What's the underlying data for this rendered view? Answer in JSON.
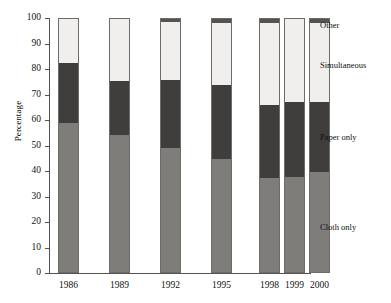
{
  "chart_data": {
    "type": "bar",
    "stacked": true,
    "title": "",
    "xlabel": "",
    "ylabel": "Percentage",
    "ylim": [
      0,
      100
    ],
    "yticks": [
      0,
      10,
      20,
      30,
      40,
      50,
      60,
      70,
      80,
      90,
      100
    ],
    "grid": false,
    "legend_position": "right",
    "categories": [
      "1986",
      "1989",
      "1992",
      "1995",
      "1998",
      "1999",
      "2000"
    ],
    "series": [
      {
        "name": "Cloth only",
        "color": "#7e7d7a",
        "values": [
          59,
          54,
          49,
          44.5,
          37,
          37.5,
          39.5
        ]
      },
      {
        "name": "Paper only",
        "color": "#3f3e3d",
        "values": [
          23.5,
          21.5,
          27,
          29.5,
          29,
          29.5,
          27.5
        ]
      },
      {
        "name": "Simultaneous",
        "color": "#f0efed",
        "values": [
          17.5,
          24.5,
          23,
          24.5,
          32.5,
          33,
          31.5
        ]
      },
      {
        "name": "Other",
        "color": "#55534f",
        "values": [
          0,
          0,
          1,
          1.5,
          1.5,
          0,
          1.5
        ]
      }
    ],
    "cumulative_tops": {
      "cloth_only": [
        59,
        54,
        49,
        44.5,
        37,
        37.5,
        39.5
      ],
      "paper_only": [
        82.5,
        75.5,
        76,
        74,
        66,
        67,
        67
      ],
      "simultaneous": [
        100,
        100,
        99,
        98.5,
        98.5,
        100,
        98.5
      ],
      "other": [
        100,
        100,
        100,
        100,
        100,
        100,
        100
      ]
    }
  },
  "legend": {
    "items": [
      {
        "label": "Other"
      },
      {
        "label": "Simultaneous"
      },
      {
        "label": "Paper only"
      },
      {
        "label": "Cloth only"
      }
    ]
  }
}
